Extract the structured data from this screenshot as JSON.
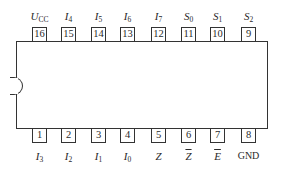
{
  "chip": {
    "package": "DIP-16",
    "notch": "left"
  },
  "top_pins": [
    {
      "number": "16",
      "label": "U",
      "sub": "CC",
      "overbar": false,
      "x": 32
    },
    {
      "number": "15",
      "label": "I",
      "sub": "4",
      "overbar": false,
      "x": 61
    },
    {
      "number": "14",
      "label": "I",
      "sub": "5",
      "overbar": false,
      "x": 91
    },
    {
      "number": "13",
      "label": "I",
      "sub": "6",
      "overbar": false,
      "x": 120
    },
    {
      "number": "12",
      "label": "I",
      "sub": "7",
      "overbar": false,
      "x": 151
    },
    {
      "number": "11",
      "label": "S",
      "sub": "0",
      "overbar": false,
      "x": 181
    },
    {
      "number": "10",
      "label": "S",
      "sub": "1",
      "overbar": false,
      "x": 210
    },
    {
      "number": "9",
      "label": "S",
      "sub": "2",
      "overbar": false,
      "x": 241
    }
  ],
  "bottom_pins": [
    {
      "number": "1",
      "label": "I",
      "sub": "3",
      "overbar": false,
      "x": 32
    },
    {
      "number": "2",
      "label": "I",
      "sub": "2",
      "overbar": false,
      "x": 61
    },
    {
      "number": "3",
      "label": "I",
      "sub": "1",
      "overbar": false,
      "x": 91
    },
    {
      "number": "4",
      "label": "I",
      "sub": "0",
      "overbar": false,
      "x": 120
    },
    {
      "number": "5",
      "label": "Z",
      "sub": "",
      "overbar": false,
      "x": 151
    },
    {
      "number": "6",
      "label": "Z",
      "sub": "",
      "overbar": true,
      "x": 181
    },
    {
      "number": "7",
      "label": "E",
      "sub": "",
      "overbar": true,
      "x": 210
    },
    {
      "number": "8",
      "label": "GND",
      "sub": "",
      "overbar": false,
      "x": 241
    }
  ]
}
